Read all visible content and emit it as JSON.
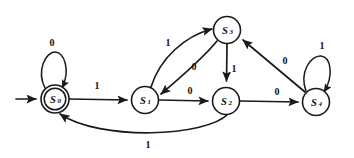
{
  "diagram": {
    "type": "state-transition-diagram",
    "stroke_color": "#1a1a1a",
    "background_color": "#ffffff",
    "start_marker": "arrow-into-S0",
    "states": [
      {
        "id": "S0",
        "label": "S",
        "subscript": "0",
        "cx": 55,
        "cy": 99,
        "r": 14,
        "accepting": true,
        "inner_r": 11
      },
      {
        "id": "S1",
        "label": "S",
        "subscript": "1",
        "cx": 145,
        "cy": 100,
        "r": 13.5,
        "accepting": false
      },
      {
        "id": "S2",
        "label": "S",
        "subscript": "2",
        "cx": 226,
        "cy": 101,
        "r": 13.5,
        "accepting": false
      },
      {
        "id": "S3",
        "label": "S",
        "subscript": "3",
        "cx": 227,
        "cy": 30,
        "r": 13.5,
        "accepting": false
      },
      {
        "id": "S4",
        "label": "S",
        "subscript": "4",
        "cx": 316,
        "cy": 102,
        "r": 13.5,
        "accepting": false
      }
    ],
    "transitions": [
      {
        "from": "S0",
        "to": "S0",
        "label": "0",
        "shape": "self-loop-top",
        "label_x": 52,
        "label_y": 42
      },
      {
        "from": "S0",
        "to": "S1",
        "label": "1",
        "shape": "straight",
        "label_x": 97,
        "label_y": 85
      },
      {
        "from": "S1",
        "to": "S3",
        "label": "1",
        "shape": "curve-up-right",
        "label_x": 168,
        "label_y": 42
      },
      {
        "from": "S3",
        "to": "S1",
        "label": "0",
        "shape": "curve-down-left",
        "label_x": 194,
        "label_y": 66
      },
      {
        "from": "S1",
        "to": "S2",
        "label": "0",
        "shape": "straight",
        "label_x": 190,
        "label_y": 90
      },
      {
        "from": "S3",
        "to": "S2",
        "label": "1",
        "shape": "straight-down",
        "label_x": 234,
        "label_y": 68
      },
      {
        "from": "S2",
        "to": "S4",
        "label": "0",
        "shape": "straight",
        "label_x": 277,
        "label_y": 91
      },
      {
        "from": "S4",
        "to": "S3",
        "label": "0",
        "shape": "straight-up-left",
        "label_x": 285,
        "label_y": 60
      },
      {
        "from": "S4",
        "to": "S4",
        "label": "1",
        "shape": "self-loop-top",
        "label_x": 322,
        "label_y": 45
      },
      {
        "from": "S2",
        "to": "S0",
        "label": "1",
        "shape": "curve-bottom",
        "label_x": 148,
        "label_y": 144
      }
    ]
  }
}
